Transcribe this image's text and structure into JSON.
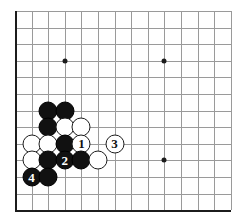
{
  "board": {
    "title": "Go board diagram",
    "type": "go-board-diagram",
    "columns": 14,
    "rows": 13,
    "visible_grid_lines_vertical": 14,
    "visible_grid_lines_horizontal": 13,
    "origin_x": 15,
    "origin_y": 11,
    "spacing": 16.6,
    "grid_color": "#9a9a9a",
    "edge_color": "#1c1c1c",
    "background_color": "#ffffff",
    "black_color": "#111111",
    "white_color": "#ffffff",
    "star_points": [
      {
        "name": "star-point-left",
        "col": 3,
        "row": 3
      },
      {
        "name": "star-point-right",
        "col": 9,
        "row": 3
      },
      {
        "name": "star-point-lower-right",
        "col": 9,
        "row": 9
      }
    ],
    "stones": [
      {
        "id": "b1",
        "color": "black",
        "col": 2,
        "row": 6,
        "label": ""
      },
      {
        "id": "b2",
        "color": "black",
        "col": 3,
        "row": 6,
        "label": ""
      },
      {
        "id": "b3",
        "color": "black",
        "col": 2,
        "row": 7,
        "label": ""
      },
      {
        "id": "w1",
        "color": "white",
        "col": 3,
        "row": 7,
        "label": ""
      },
      {
        "id": "w2",
        "color": "white",
        "col": 4,
        "row": 7,
        "label": ""
      },
      {
        "id": "w3",
        "color": "white",
        "col": 1,
        "row": 8,
        "label": ""
      },
      {
        "id": "w4",
        "color": "white",
        "col": 2,
        "row": 8,
        "label": ""
      },
      {
        "id": "b4",
        "color": "black",
        "col": 3,
        "row": 8,
        "label": ""
      },
      {
        "id": "m1",
        "color": "white",
        "col": 4,
        "row": 8,
        "label": "1"
      },
      {
        "id": "m3",
        "color": "white",
        "col": 6,
        "row": 8,
        "label": "3"
      },
      {
        "id": "w5",
        "color": "white",
        "col": 1,
        "row": 9,
        "label": ""
      },
      {
        "id": "b5",
        "color": "black",
        "col": 2,
        "row": 9,
        "label": ""
      },
      {
        "id": "m2",
        "color": "black",
        "col": 3,
        "row": 9,
        "label": "2"
      },
      {
        "id": "b6",
        "color": "black",
        "col": 4,
        "row": 9,
        "label": ""
      },
      {
        "id": "w6",
        "color": "white",
        "col": 5,
        "row": 9,
        "label": ""
      },
      {
        "id": "m4",
        "color": "black",
        "col": 1,
        "row": 10,
        "label": "4"
      },
      {
        "id": "b7",
        "color": "black",
        "col": 2,
        "row": 10,
        "label": ""
      }
    ]
  }
}
